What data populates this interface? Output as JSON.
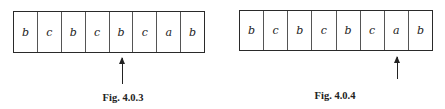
{
  "figures": [
    {
      "caption": "Fig. 4.0.3",
      "cells": [
        "b",
        "c",
        "b",
        "c",
        "b",
        "c",
        "a",
        "b"
      ],
      "head_position_index": 4
    },
    {
      "caption": "Fig. 4.0.4",
      "cells": [
        "b",
        "c",
        "b",
        "c",
        "b",
        "c",
        "a",
        "b"
      ],
      "head_position_index": 6
    }
  ]
}
